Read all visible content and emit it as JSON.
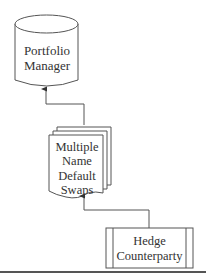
{
  "diagram": {
    "type": "flowchart",
    "stroke_color": "#555555",
    "text_color": "#333333",
    "nodes": [
      {
        "id": "portfolio-manager",
        "shape": "cylinder",
        "lines": [
          "Portfolio",
          "Manager"
        ]
      },
      {
        "id": "multiple-name-default-swaps",
        "shape": "multi-document",
        "lines": [
          "Multiple",
          "Name",
          "Default",
          "Swaps"
        ]
      },
      {
        "id": "hedge-counterparty",
        "shape": "predefined-process",
        "lines": [
          "Hedge",
          "Counterparty"
        ]
      }
    ],
    "edges": [
      {
        "from": "multiple-name-default-swaps",
        "to": "portfolio-manager",
        "style": "orthogonal-arrow"
      },
      {
        "from": "hedge-counterparty",
        "to": "multiple-name-default-swaps",
        "style": "orthogonal-arrow"
      }
    ]
  }
}
